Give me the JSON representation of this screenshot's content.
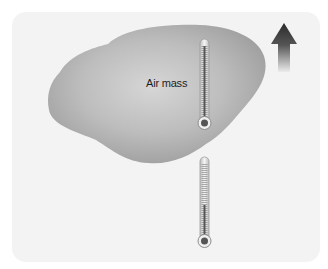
{
  "diagram": {
    "air_mass": {
      "label": "Air mass",
      "fill_color": "#a9a9a9",
      "highlight_color": "#d4d4d4"
    },
    "thermometers": [
      {
        "name": "thermometer-inside-air-mass",
        "level_percent": 95
      },
      {
        "name": "thermometer-below-air-mass",
        "level_percent": 45
      }
    ],
    "arrow": {
      "direction": "up",
      "top_color": "#2b2b2b",
      "bottom_color": "#e6e6e6"
    },
    "background_color": "#f3f3f3"
  }
}
